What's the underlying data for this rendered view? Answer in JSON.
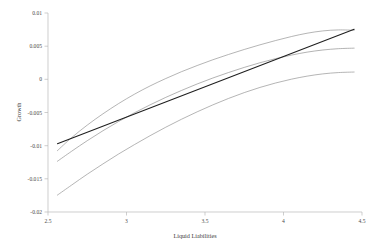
{
  "chart_data": {
    "type": "line",
    "title": "",
    "subtitle": "",
    "xlabel": "Liquid Liabilities",
    "ylabel": "Growth",
    "xlim": [
      2.5,
      4.5
    ],
    "ylim": [
      -0.02,
      0.01
    ],
    "grid": false,
    "legend_position": "none",
    "x_ticks": [
      "2.5",
      "3",
      "3.5",
      "4",
      "4.5"
    ],
    "x_tick_values": [
      2.5,
      3,
      3.5,
      4,
      4.5
    ],
    "y_ticks": [
      "0.01",
      "0.005",
      "0",
      "-0.005",
      "-0.01",
      "-0.015",
      "-0.02"
    ],
    "y_tick_values": [
      0.01,
      0.005,
      0,
      -0.005,
      -0.01,
      -0.015,
      -0.02
    ],
    "series": [
      {
        "name": "upper-confidence-band",
        "style": "thin-grey-curve",
        "color": "#8d8d8d",
        "x": [
          2.56,
          2.65,
          2.75,
          2.85,
          2.95,
          3.05,
          3.15,
          3.25,
          3.35,
          3.45,
          3.55,
          3.65,
          3.75,
          3.85,
          3.95,
          4.05,
          4.15,
          4.25,
          4.35,
          4.45
        ],
        "y": [
          -0.01075,
          -0.0088,
          -0.0069,
          -0.0052,
          -0.00365,
          -0.00225,
          -0.001,
          0.00012,
          0.00115,
          0.00208,
          0.00295,
          0.00375,
          0.0045,
          0.0052,
          0.00585,
          0.00645,
          0.00695,
          0.0073,
          0.00745,
          0.0074
        ]
      },
      {
        "name": "fitted-curve",
        "style": "thin-grey-curve",
        "color": "#8a8a8a",
        "x": [
          2.56,
          2.65,
          2.75,
          2.85,
          2.95,
          3.05,
          3.15,
          3.25,
          3.35,
          3.45,
          3.55,
          3.65,
          3.75,
          3.85,
          3.95,
          4.05,
          4.15,
          4.25,
          4.35,
          4.45
        ],
        "y": [
          -0.01235,
          -0.01085,
          -0.00925,
          -0.00775,
          -0.00635,
          -0.00505,
          -0.00385,
          -0.00272,
          -0.00168,
          -0.0007,
          0.0002,
          0.00103,
          0.0018,
          0.0025,
          0.00312,
          0.00365,
          0.0041,
          0.00442,
          0.00462,
          0.0047
        ]
      },
      {
        "name": "lower-confidence-band",
        "style": "thin-grey-curve",
        "color": "#8d8d8d",
        "x": [
          2.56,
          2.65,
          2.75,
          2.85,
          2.95,
          3.05,
          3.15,
          3.25,
          3.35,
          3.45,
          3.55,
          3.65,
          3.75,
          3.85,
          3.95,
          4.05,
          4.15,
          4.25,
          4.35,
          4.45
        ],
        "y": [
          -0.01745,
          -0.01595,
          -0.0143,
          -0.01275,
          -0.01125,
          -0.00985,
          -0.0085,
          -0.00722,
          -0.00602,
          -0.0049,
          -0.00385,
          -0.00288,
          -0.002,
          -0.00122,
          -0.00055,
          2e-05,
          0.00048,
          0.00082,
          0.00102,
          0.0011
        ]
      },
      {
        "name": "linear-fit",
        "style": "thick-dark-line",
        "color": "#1f1f1f",
        "x": [
          2.56,
          4.45
        ],
        "y": [
          -0.0097,
          0.00755
        ]
      }
    ]
  },
  "axes": {
    "y_title": "Growth",
    "x_title": "Liquid Liabilities"
  }
}
